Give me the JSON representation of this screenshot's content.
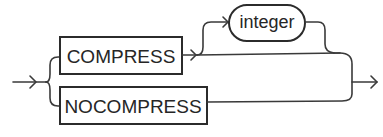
{
  "diagram": {
    "type": "railroad-syntax",
    "options": [
      {
        "label": "COMPRESS",
        "kind": "keyword"
      },
      {
        "label": "NOCOMPRESS",
        "kind": "keyword"
      }
    ],
    "optional_parameter": {
      "label": "integer",
      "kind": "variable",
      "follows": "COMPRESS"
    }
  },
  "colors": {
    "stroke": "#2b2b2b",
    "background": "#ffffff"
  }
}
